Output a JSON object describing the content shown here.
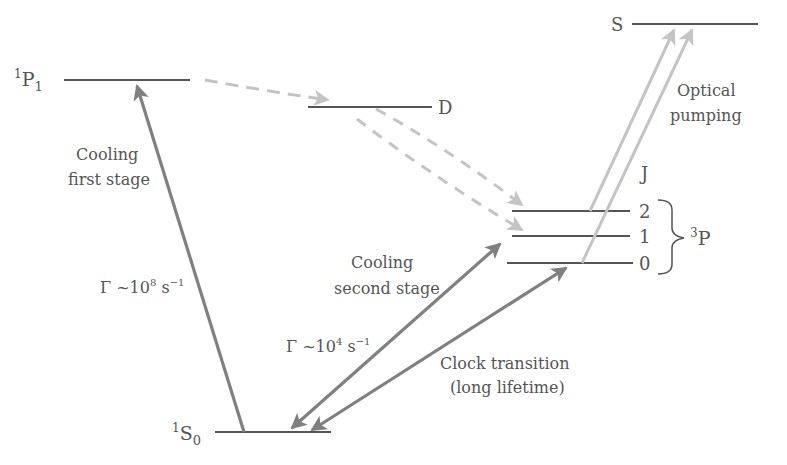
{
  "diagram": {
    "colors": {
      "level": "#555555",
      "strong_arrow": "#808080",
      "light_arrow": "#bdbdbd",
      "text": "#555555"
    },
    "levels": [
      {
        "id": "1P1",
        "label_sup": "1",
        "label_main": "P",
        "label_sub": "1",
        "x1": 64,
        "x2": 190,
        "y": 80
      },
      {
        "id": "D",
        "label_main": "D",
        "x1": 308,
        "x2": 432,
        "y": 107
      },
      {
        "id": "S",
        "label_main": "S",
        "x1": 632,
        "x2": 758,
        "y": 24
      },
      {
        "id": "3P2",
        "label_main": "2",
        "x1": 512,
        "x2": 630,
        "y": 211
      },
      {
        "id": "3P1",
        "label_main": "1",
        "x1": 512,
        "x2": 630,
        "y": 236
      },
      {
        "id": "3P0",
        "label_main": "0",
        "x1": 507,
        "x2": 633,
        "y": 263
      },
      {
        "id": "1S0",
        "label_sup": "1",
        "label_main": "S",
        "label_sub": "0",
        "x1": 215,
        "x2": 331,
        "y": 432
      }
    ],
    "labels": {
      "j_header": "J",
      "triplet_sup": "3",
      "triplet_main": "P",
      "p1_sup": "1",
      "p1_main": "P",
      "p1_sub": "1",
      "s0_sup": "1",
      "s0_main": "S",
      "s0_sub": "0",
      "d_label": "D",
      "s_label": "S",
      "j2": "2",
      "j1": "1",
      "j0": "0",
      "cooling_first_line1": "Cooling",
      "cooling_first_line2": "first stage",
      "gamma_first": "Γ ~10",
      "gamma_first_exp": "8",
      "gamma_first_unit": " s",
      "gamma_first_unit_exp": "−1",
      "cooling_second_line1": "Cooling",
      "cooling_second_line2": "second stage",
      "gamma_second": "Γ ~10",
      "gamma_second_exp": "4",
      "gamma_second_unit": " s",
      "gamma_second_unit_exp": "−1",
      "clock_line1": "Clock transition",
      "clock_line2": "(long lifetime)",
      "optical_line1": "Optical",
      "optical_line2": "pumping"
    },
    "transitions": [
      {
        "name": "cooling-first-stage",
        "from": "1S0",
        "to": "1P1",
        "style": "solid",
        "direction": "up"
      },
      {
        "name": "cooling-second-stage",
        "from": "1S0",
        "to": "3P1",
        "style": "solid",
        "direction": "both"
      },
      {
        "name": "clock-transition",
        "from": "1S0",
        "to": "3P0",
        "style": "solid",
        "direction": "both"
      },
      {
        "name": "decay-1P1-to-D",
        "from": "1P1",
        "to": "D",
        "style": "dashed"
      },
      {
        "name": "decay-D-to-3P2",
        "from": "D",
        "to": "3P2",
        "style": "dashed"
      },
      {
        "name": "decay-D-to-3P1",
        "from": "D",
        "to": "3P1",
        "style": "dashed"
      },
      {
        "name": "pump-3P2-to-S",
        "from": "3P2",
        "to": "S",
        "style": "light"
      },
      {
        "name": "pump-3P0-to-S",
        "from": "3P0",
        "to": "S",
        "style": "light"
      }
    ]
  }
}
